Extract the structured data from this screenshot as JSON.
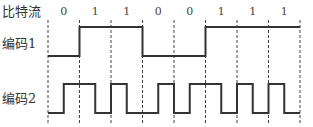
{
  "labels": {
    "bitstream": "比特流",
    "code1": "编码1",
    "code2": "编码2"
  },
  "bits": [
    "0",
    "1",
    "1",
    "0",
    "0",
    "1",
    "1",
    "1"
  ],
  "encodings": {
    "code1": {
      "name": "NRZ",
      "levels": [
        0,
        1,
        1,
        0,
        0,
        1,
        1,
        1
      ]
    },
    "code2": {
      "name": "Manchester",
      "halves": [
        [
          0,
          1
        ],
        [
          1,
          0
        ],
        [
          1,
          0
        ],
        [
          0,
          1
        ],
        [
          0,
          1
        ],
        [
          1,
          0
        ],
        [
          1,
          0
        ],
        [
          1,
          0
        ]
      ]
    }
  },
  "colors": {
    "line": "#333333",
    "text": "#333333"
  }
}
